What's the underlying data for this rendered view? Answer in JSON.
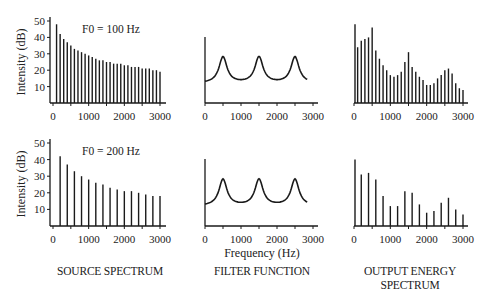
{
  "figure": {
    "captions": {
      "source": "SOURCE SPECTRUM",
      "filter": "FILTER FUNCTION",
      "output_line1": "OUTPUT ENERGY",
      "output_line2": "SPECTRUM"
    },
    "shared_xlabel": "Frequency (Hz)",
    "ylabel": "Intensity (dB)"
  },
  "chart_data": [
    {
      "type": "bar",
      "panel": "source-spectrum-f0-100",
      "title": "F0 = 100 Hz",
      "xlabel": "",
      "ylabel": "Intensity (dB)",
      "x": [
        100,
        200,
        300,
        400,
        500,
        600,
        700,
        800,
        900,
        1000,
        1100,
        1200,
        1300,
        1400,
        1500,
        1600,
        1700,
        1800,
        1900,
        2000,
        2100,
        2200,
        2300,
        2400,
        2500,
        2600,
        2700,
        2800,
        2900,
        3000
      ],
      "values": [
        48,
        42,
        39,
        37,
        35,
        33,
        32,
        31,
        30,
        29,
        28,
        27,
        26,
        26,
        25,
        25,
        24,
        24,
        24,
        23,
        23,
        22,
        22,
        22,
        21,
        21,
        21,
        20,
        20,
        19
      ],
      "xticks": [
        0,
        1000,
        2000,
        3000
      ],
      "yticks": [
        10,
        20,
        30,
        40,
        50
      ],
      "xlim": [
        0,
        3000
      ],
      "ylim": [
        0,
        50
      ]
    },
    {
      "type": "line",
      "panel": "filter-function-top",
      "title": "",
      "xlabel": "",
      "ylabel": "",
      "formant_peaks_hz": [
        500,
        1500,
        2500
      ],
      "xticks": [
        0,
        1000,
        2000,
        3000
      ],
      "xlim": [
        0,
        3000
      ]
    },
    {
      "type": "bar",
      "panel": "output-spectrum-f0-100",
      "title": "",
      "xlabel": "",
      "ylabel": "",
      "x": [
        0,
        100,
        200,
        300,
        400,
        500,
        600,
        700,
        800,
        900,
        1000,
        1100,
        1200,
        1300,
        1400,
        1500,
        1600,
        1700,
        1800,
        1900,
        2000,
        2100,
        2200,
        2300,
        2400,
        2500,
        2600,
        2700,
        2800,
        2900,
        3000
      ],
      "values": [
        48,
        34,
        38,
        39,
        40,
        46,
        32,
        27,
        23,
        20,
        17,
        16,
        17,
        19,
        25,
        31,
        22,
        19,
        16,
        14,
        11,
        11,
        12,
        15,
        17,
        20,
        21,
        18,
        12,
        9,
        8
      ],
      "xticks": [
        0,
        1000,
        2000,
        3000
      ],
      "xlim": [
        0,
        3000
      ]
    },
    {
      "type": "bar",
      "panel": "source-spectrum-f0-200",
      "title": "F0 = 200 Hz",
      "xlabel": "",
      "ylabel": "Intensity (dB)",
      "x": [
        200,
        400,
        600,
        800,
        1000,
        1200,
        1400,
        1600,
        1800,
        2000,
        2200,
        2400,
        2600,
        2800,
        3000
      ],
      "values": [
        42,
        37,
        33,
        30,
        28,
        26,
        25,
        23,
        22,
        21,
        21,
        20,
        19,
        18,
        18
      ],
      "xticks": [
        0,
        1000,
        2000,
        3000
      ],
      "yticks": [
        10,
        20,
        30,
        40,
        50
      ],
      "xlim": [
        0,
        3000
      ],
      "ylim": [
        0,
        50
      ]
    },
    {
      "type": "line",
      "panel": "filter-function-bottom",
      "title": "",
      "xlabel": "Frequency (Hz)",
      "ylabel": "",
      "formant_peaks_hz": [
        500,
        1500,
        2500
      ],
      "xticks": [
        0,
        1000,
        2000,
        3000
      ],
      "xlim": [
        0,
        3000
      ]
    },
    {
      "type": "bar",
      "panel": "output-spectrum-f0-200",
      "title": "",
      "xlabel": "",
      "ylabel": "",
      "x": [
        0,
        200,
        400,
        600,
        800,
        1000,
        1200,
        1400,
        1600,
        1800,
        2000,
        2200,
        2400,
        2600,
        2800,
        3000
      ],
      "values": [
        40,
        31,
        32,
        28,
        18,
        12,
        12,
        21,
        20,
        13,
        8,
        9,
        14,
        17,
        10,
        7
      ],
      "xticks": [
        0,
        1000,
        2000,
        3000
      ],
      "xlim": [
        0,
        3000
      ]
    }
  ]
}
